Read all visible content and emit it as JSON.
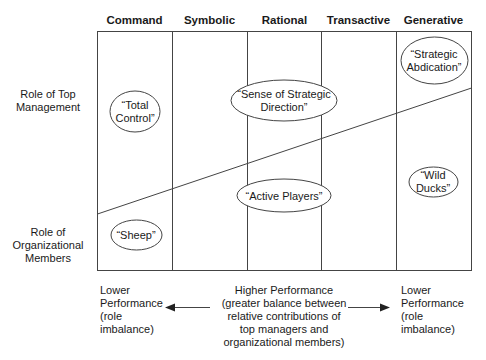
{
  "columns": [
    {
      "label": "Command"
    },
    {
      "label": "Symbolic"
    },
    {
      "label": "Rational"
    },
    {
      "label": "Transactive"
    },
    {
      "label": "Generative"
    }
  ],
  "rows": {
    "top": {
      "line1": "Role of Top",
      "line2": "Management"
    },
    "bottom": {
      "line1": "Role of",
      "line2": "Organizational",
      "line3": "Members"
    }
  },
  "ellipses": {
    "total_control": {
      "line1": "“Total",
      "line2": "Control”"
    },
    "sense_direction": {
      "line1": "“Sense of Strategic",
      "line2": "Direction”"
    },
    "strategic_abdication": {
      "line1": "“Strategic",
      "line2": "Abdication”"
    },
    "active_players": {
      "line1": "“Active Players”"
    },
    "wild_ducks": {
      "line1": "“Wild",
      "line2": "Ducks”"
    },
    "sheep": {
      "line1": "“Sheep”"
    }
  },
  "footer": {
    "left": {
      "line1": "Lower",
      "line2": "Performance",
      "line3": "(role",
      "line4": "imbalance)"
    },
    "center": {
      "line1": "Higher Performance",
      "line2": "(greater balance between",
      "line3": "relative contributions of",
      "line4": "top managers and",
      "line5": "organizational members)"
    },
    "right": {
      "line1": "Lower",
      "line2": "Performance",
      "line3": "(role",
      "line4": "imbalance)"
    }
  },
  "colors": {
    "line": "#444444",
    "text": "#1a1a1a"
  }
}
